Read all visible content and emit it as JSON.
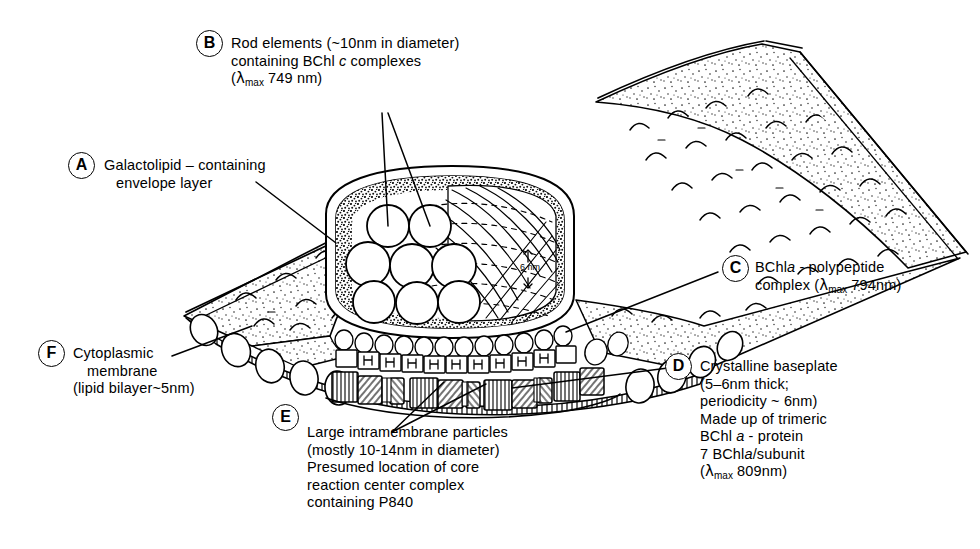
{
  "figure": {
    "background_color": "#ffffff",
    "ink_color": "#000000"
  },
  "scale_annotation": {
    "name": "6nm-periodicity-marker",
    "value": "6",
    "unit": "nm"
  },
  "callouts": [
    {
      "key": "A",
      "badge": "A",
      "lines": [
        "Galactolipid – containing",
        "envelope layer"
      ]
    },
    {
      "key": "B",
      "badge": "B",
      "lines": [
        "Rod elements (~10nm in diameter)",
        "containing BChl c complexes",
        "(λmax 749 nm)"
      ],
      "line1": "Rod elements  (~10nm in diameter)",
      "line2_pre": "containing BChl ",
      "line2_ital": "c",
      "line2_post": " complexes",
      "line3_pre": "(",
      "line3_lam": "λ",
      "line3_sub": "max",
      "line3_post": " 749 nm)"
    },
    {
      "key": "C",
      "badge": "C",
      "lines": [
        "BChl a - polypeptide",
        "complex (λmax 794nm)"
      ],
      "line1_pre": "BChl",
      "line1_ital": "a",
      "line1_post": " - polypeptide",
      "line2_pre": "complex (",
      "line2_lam": "λ",
      "line2_sub": "max",
      "line2_post": " 794nm)"
    },
    {
      "key": "D",
      "badge": "D",
      "lines": [
        "Crystalline baseplate",
        "(5–6nm thick;",
        "periodicity ~ 6nm)",
        "Made up of trimeric",
        "BChl a - protein",
        "7 BChl a/subunit",
        "(λmax 809nm)"
      ],
      "line1": "Crystalline baseplate",
      "line2": "(5–6nm thick;",
      "line3": " periodicity ~ 6nm)",
      "line4": "Made up of trimeric",
      "line5_pre": "BChl ",
      "line5_ital": "a",
      "line5_post": " - protein",
      "line6_pre": "7 BChl",
      "line6_ital": "a",
      "line6_post": "/subunit",
      "line7_pre": "(",
      "line7_lam": "λ",
      "line7_sub": "max",
      "line7_post": " 809nm)"
    },
    {
      "key": "E",
      "badge": "E",
      "lines": [
        "Large intramembrane particles",
        "(mostly 10–14nm in diameter)",
        "Presumed location of core",
        "reaction center complex",
        "containing P840"
      ],
      "line1": "Large intramembrane particles",
      "line2": "(mostly 10-14nm in diameter)",
      "line3": "Presumed location of core",
      "line4": "reaction center complex",
      "line5": "containing P840"
    },
    {
      "key": "F",
      "badge": "F",
      "lines": [
        "Cytoplasmic",
        "membrane",
        "(lipid bilayer~5nm)"
      ],
      "line1": "Cytoplasmic",
      "line2": "membrane",
      "line3": "(lipid bilayer~5nm)"
    }
  ],
  "structures": {
    "membrane_sheet": "cytoplasmic-membrane-sheet",
    "chlorosome_body": "chlorosome-envelope",
    "rod_elements_count": 8,
    "baseplate": "crystalline-baseplate",
    "intramembrane_particles": "large-intramembrane-particles"
  }
}
